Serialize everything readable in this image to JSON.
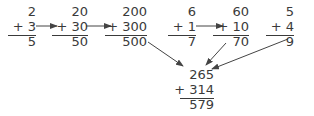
{
  "problems": [
    {
      "top": "2",
      "addend": "+ 3",
      "sum": "5"
    },
    {
      "top": "20",
      "addend": "+ 30",
      "sum": "50"
    },
    {
      "top": "200",
      "addend": "+ 300",
      "sum": "500"
    },
    {
      "top": "6",
      "addend": "+ 1",
      "sum": "7"
    },
    {
      "top": "60",
      "addend": "+ 10",
      "sum": "70"
    },
    {
      "top": "5",
      "addend": "+ 4",
      "sum": "9"
    }
  ],
  "final": {
    "top": "265",
    "addend": "+ 314",
    "sum": "579"
  },
  "colors": {
    "text": "#3a3a3a",
    "arrow": "#444444"
  }
}
